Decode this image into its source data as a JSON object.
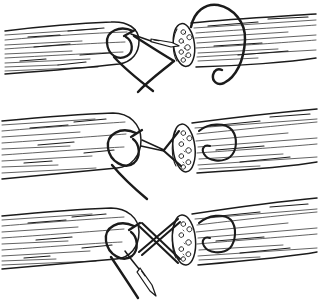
{
  "canvas": {
    "width": 319,
    "height": 306
  },
  "colors": {
    "ink": "#1b1b1b",
    "paper": "#ffffff"
  },
  "figure": {
    "kind": "pen-and-ink illustration of a three-step end-to-end suture joining two severed tendon stumps",
    "panels": [
      {
        "name": "step-1",
        "description": "needle passing into the cut face of the right stump; anchor loop in left stump; long suture loop encircling the right stump"
      },
      {
        "name": "step-2",
        "description": "threads crossed between the stumps; anchor loop on each stump; free thread hanging from the left stump"
      },
      {
        "name": "step-3",
        "description": "double criss-cross threads between the stumps; needle and thread hanging below the left stump"
      }
    ]
  }
}
